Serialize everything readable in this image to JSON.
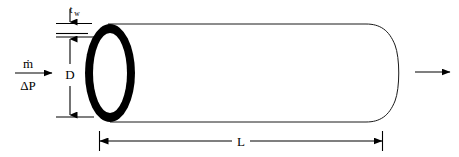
{
  "figure": {
    "type": "engineering-schematic",
    "background_color": "#ffffff",
    "line_color": "#1a1a1a",
    "fill_color": "#000000"
  },
  "labels": {
    "wall_thickness": {
      "base": "t",
      "subscript": "w",
      "full": "t_w",
      "meaning": "wall thickness"
    },
    "diameter": {
      "text": "D",
      "meaning": "inner diameter"
    },
    "length": {
      "text": "L",
      "meaning": "pipe length"
    },
    "mass_flow_rate": {
      "text": "ṁ",
      "meaning": "mass flow rate"
    },
    "pressure_drop": {
      "text": "ΔP",
      "meaning": "pressure drop"
    }
  },
  "annotations": {
    "inlet_arrow": "flow-in-arrow",
    "outlet_arrow": "flow-out-arrow",
    "diameter_dimension": "vertical-double-arrow",
    "length_dimension": "horizontal-double-arrow",
    "thickness_callout": "down-arrow"
  },
  "geometry": {
    "ring_center_x": 110,
    "ring_center_y": 73,
    "ring_outer_rx": 25,
    "ring_outer_ry": 49,
    "ring_inner_rx": 18,
    "ring_inner_ry": 41,
    "body_top_y": 24,
    "body_bottom_y": 122,
    "body_right_x": 383,
    "cap_bulge_x": 408,
    "length_dim_y": 141,
    "length_dim_left_x": 99,
    "length_dim_right_x": 383,
    "diameter_dim_x": 70,
    "diameter_top_y": 37,
    "diameter_bottom_y": 117
  }
}
